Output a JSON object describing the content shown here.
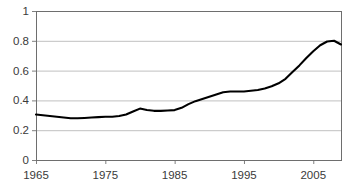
{
  "chart_data": {
    "type": "line",
    "title": "",
    "subtitle": "",
    "xlabel": "",
    "ylabel": "",
    "xlim": [
      1965,
      2009
    ],
    "ylim": [
      0,
      1
    ],
    "grid": true,
    "legend": null,
    "legend_position": "none",
    "line_color": "#000000",
    "grid_color": "#c0c0c0",
    "axis_color": "#808080",
    "x_ticks": [
      1965,
      1975,
      1985,
      1995,
      2005
    ],
    "x_tick_labels": [
      "1965",
      "1975",
      "1985",
      "1995",
      "2005"
    ],
    "y_ticks": [
      0,
      0.2,
      0.4,
      0.6,
      0.8,
      1
    ],
    "y_tick_labels": [
      "0",
      "0.2",
      "0.4",
      "0.6",
      "0.8",
      "1"
    ],
    "series": [
      {
        "name": "series-1",
        "x": [
          1965,
          1966,
          1967,
          1968,
          1969,
          1970,
          1971,
          1972,
          1973,
          1974,
          1975,
          1976,
          1977,
          1978,
          1979,
          1980,
          1981,
          1982,
          1983,
          1984,
          1985,
          1986,
          1987,
          1988,
          1989,
          1990,
          1991,
          1992,
          1993,
          1994,
          1995,
          1996,
          1997,
          1998,
          1999,
          2000,
          2001,
          2002,
          2003,
          2004,
          2005,
          2006,
          2007,
          2008,
          2009
        ],
        "values": [
          0.305,
          0.3,
          0.295,
          0.29,
          0.285,
          0.28,
          0.28,
          0.282,
          0.285,
          0.288,
          0.29,
          0.29,
          0.295,
          0.305,
          0.325,
          0.345,
          0.335,
          0.33,
          0.33,
          0.332,
          0.335,
          0.35,
          0.375,
          0.395,
          0.41,
          0.425,
          0.44,
          0.455,
          0.46,
          0.46,
          0.46,
          0.465,
          0.47,
          0.48,
          0.495,
          0.515,
          0.545,
          0.59,
          0.635,
          0.685,
          0.73,
          0.77,
          0.795,
          0.8,
          0.775
        ]
      }
    ]
  },
  "axes": {
    "frame": {
      "left": 36,
      "top": 11,
      "right": 341,
      "bottom": 160
    }
  }
}
